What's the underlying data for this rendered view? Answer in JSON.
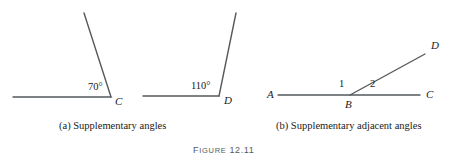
{
  "figure": {
    "caption_prefix_first": "F",
    "caption_prefix_rest": "IGURE",
    "caption_number": "12.11",
    "line_color": "#55595c",
    "text_color": "#1a1a1a",
    "caption_color": "#555a5e",
    "background": "#ffffff"
  },
  "panels": [
    {
      "id": "a",
      "subcaption": "(a) Supplementary angles",
      "diagrams": [
        {
          "id": "a-left",
          "vertex_label": "C",
          "angle_measure": "70°",
          "angle_degrees": 70
        },
        {
          "id": "a-right",
          "vertex_label": "D",
          "angle_measure": "110°",
          "angle_degrees": 110
        }
      ]
    },
    {
      "id": "b",
      "subcaption": "(b) Supplementary adjacent angles",
      "diagrams": [
        {
          "id": "b-main",
          "point_a": "A",
          "point_b": "B",
          "point_c": "C",
          "point_d": "D",
          "angle_one": "1",
          "angle_two": "2"
        }
      ]
    }
  ]
}
